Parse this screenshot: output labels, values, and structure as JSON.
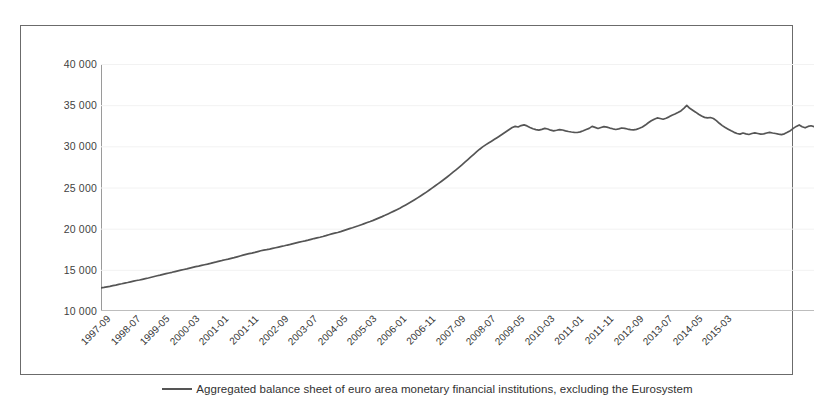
{
  "chart_data": {
    "type": "line",
    "title": "",
    "subtitle": "",
    "xlabel": "",
    "ylabel": "",
    "ylim": [
      10000,
      40000
    ],
    "yticks": [
      10000,
      15000,
      20000,
      25000,
      30000,
      35000,
      40000
    ],
    "ytick_labels": [
      "10 000",
      "15 000",
      "20 000",
      "25 000",
      "30 000",
      "35 000",
      "40 000"
    ],
    "grid": false,
    "legend_position": "bottom-center",
    "legend": [
      "Aggregated balance sheet of euro area monetary financial institutions, excluding the Eurosystem"
    ],
    "xtick_labels": [
      "1997-09",
      "1998-07",
      "1999-05",
      "2000-03",
      "2001-01",
      "2001-11",
      "2002-09",
      "2003-07",
      "2004-05",
      "2005-03",
      "2006-01",
      "2006-11",
      "2007-09",
      "2008-07",
      "2009-05",
      "2010-03",
      "2011-01",
      "2011-11",
      "2012-09",
      "2013-07",
      "2014-05",
      "2015-03"
    ],
    "xtick_step_months": 10,
    "x_start": "1997-09",
    "x_end": "2015-07",
    "series": [
      {
        "name": "Aggregated balance sheet of euro area monetary financial institutions, excluding the Eurosystem",
        "color": "#555555",
        "values": [
          12800,
          12860,
          12930,
          13000,
          13080,
          13150,
          13240,
          13310,
          13390,
          13460,
          13540,
          13620,
          13700,
          13770,
          13850,
          13930,
          14010,
          14100,
          14190,
          14280,
          14360,
          14450,
          14540,
          14620,
          14700,
          14790,
          14880,
          14960,
          15040,
          15120,
          15210,
          15300,
          15390,
          15460,
          15540,
          15620,
          15690,
          15780,
          15880,
          15960,
          16050,
          16140,
          16220,
          16300,
          16390,
          16480,
          16580,
          16680,
          16780,
          16880,
          16960,
          17030,
          17120,
          17220,
          17320,
          17400,
          17450,
          17520,
          17600,
          17680,
          17760,
          17840,
          17920,
          18010,
          18090,
          18180,
          18270,
          18360,
          18440,
          18510,
          18600,
          18700,
          18800,
          18880,
          18960,
          19050,
          19150,
          19260,
          19360,
          19450,
          19540,
          19640,
          19760,
          19880,
          20000,
          20110,
          20230,
          20350,
          20480,
          20610,
          20740,
          20870,
          21010,
          21160,
          21310,
          21460,
          21620,
          21790,
          21960,
          22130,
          22310,
          22490,
          22680,
          22880,
          23080,
          23290,
          23510,
          23740,
          23970,
          24200,
          24440,
          24690,
          24950,
          25210,
          25470,
          25730,
          26000,
          26280,
          26570,
          26860,
          27150,
          27450,
          27760,
          28070,
          28390,
          28710,
          29030,
          29350,
          29650,
          29930,
          30180,
          30400,
          30620,
          30850,
          31080,
          31320,
          31560,
          31800,
          32050,
          32280,
          32420,
          32350,
          32520,
          32600,
          32480,
          32300,
          32130,
          32030,
          31970,
          32060,
          32180,
          32100,
          31960,
          31880,
          31950,
          32030,
          31980,
          31880,
          31800,
          31740,
          31700,
          31680,
          31760,
          31900,
          32050,
          32180,
          32420,
          32300,
          32170,
          32290,
          32400,
          32340,
          32220,
          32130,
          32050,
          32120,
          32230,
          32180,
          32100,
          32040,
          31990,
          32060,
          32200,
          32350,
          32580,
          32860,
          33100,
          33300,
          33450,
          33380,
          33290,
          33420,
          33580,
          33780,
          33920,
          34100,
          34300,
          34620,
          34980,
          34620,
          34380,
          34150,
          33900,
          33680,
          33520,
          33450,
          33500,
          33380,
          33120,
          32800,
          32520,
          32280,
          32080,
          31880,
          31700,
          31560,
          31480,
          31620,
          31520,
          31440,
          31560,
          31640,
          31560,
          31480,
          31520,
          31620,
          31700,
          31620,
          31560,
          31480,
          31420,
          31520,
          31700,
          31900,
          32180,
          32420,
          32600,
          32380,
          32250,
          32420,
          32500,
          32400
        ]
      }
    ]
  },
  "axis": {
    "y_label_suffix": "",
    "x_rotation": "-45"
  }
}
